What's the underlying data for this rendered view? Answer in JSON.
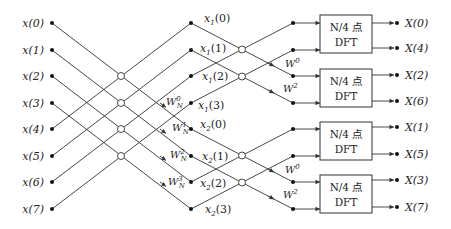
{
  "diagram": {
    "title": "",
    "inputs": [
      "x(0)",
      "x(1)",
      "x(2)",
      "x(3)",
      "x(4)",
      "x(5)",
      "x(6)",
      "x(7)"
    ],
    "first_stage_outputs": {
      "x1": [
        {
          "base": "x",
          "sub": "1",
          "arg": "(0)"
        },
        {
          "base": "x",
          "sub": "1",
          "arg": "(1)"
        },
        {
          "base": "x",
          "sub": "1",
          "arg": "(2)"
        },
        {
          "base": "x",
          "sub": "1",
          "arg": "(3)"
        }
      ],
      "x2": [
        {
          "base": "x",
          "sub": "2",
          "arg": "(0)"
        },
        {
          "base": "x",
          "sub": "2",
          "arg": "(1)"
        },
        {
          "base": "x",
          "sub": "2",
          "arg": "(2)"
        },
        {
          "base": "x",
          "sub": "2",
          "arg": "(3)"
        }
      ]
    },
    "first_stage_twiddles": [
      {
        "base": "W",
        "sup": "0",
        "sub": "N"
      },
      {
        "base": "W",
        "sup": "1",
        "sub": "N"
      },
      {
        "base": "W",
        "sup": "2",
        "sub": "N"
      },
      {
        "base": "W",
        "sup": "3",
        "sub": "N"
      }
    ],
    "second_stage_twiddles": [
      {
        "base": "W",
        "sup": "0"
      },
      {
        "base": "W",
        "sup": "2"
      },
      {
        "base": "W",
        "sup": "0"
      },
      {
        "base": "W",
        "sup": "2"
      }
    ],
    "dft_blocks": [
      {
        "line1": "N/4 点",
        "line2": "DFT"
      },
      {
        "line1": "N/4 点",
        "line2": "DFT"
      },
      {
        "line1": "N/4 点",
        "line2": "DFT"
      },
      {
        "line1": "N/4 点",
        "line2": "DFT"
      }
    ],
    "outputs": [
      "X(0)",
      "X(4)",
      "X(2)",
      "X(6)",
      "X(1)",
      "X(5)",
      "X(3)",
      "X(7)"
    ]
  }
}
